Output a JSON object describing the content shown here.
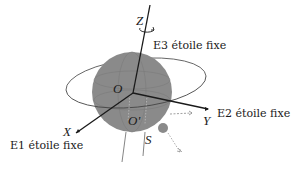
{
  "diagram": {
    "labels": {
      "z_axis": "Z",
      "e3": "E3 étoile fixe",
      "origin": "O",
      "origin_prime": "O'",
      "x_axis": "X",
      "e1": "E1 étoile fixe",
      "y_axis": "Y",
      "e2": "E2 étoile fixe",
      "satellite": "S"
    },
    "colors": {
      "sphere": "#8a8a8a",
      "axis": "#1a1a1a",
      "orbit": "#555555",
      "satellite": "#8a8a8a",
      "dashed": "#888888",
      "background": "#ffffff"
    }
  }
}
